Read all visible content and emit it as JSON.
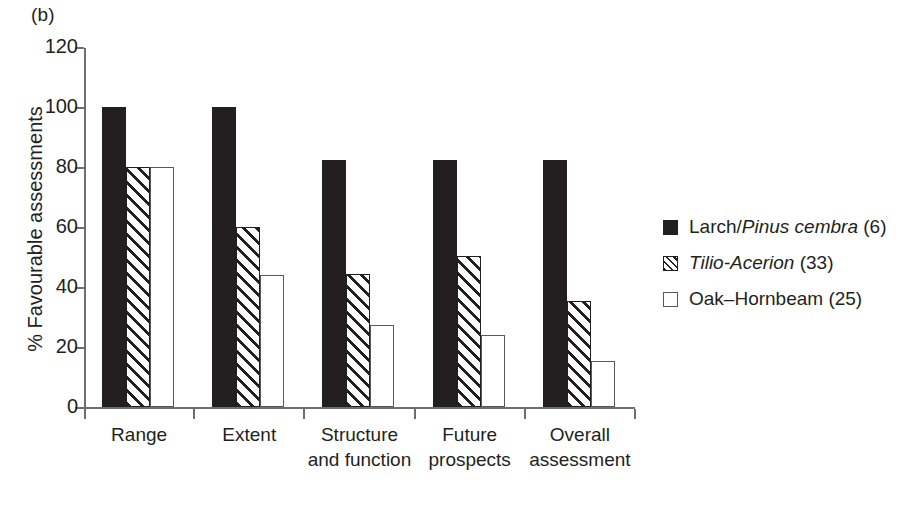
{
  "panel": {
    "label": "(b)"
  },
  "chart_data": {
    "type": "bar",
    "title": "",
    "panel_label": "(b)",
    "xlabel": "Habitat parameter",
    "ylabel": "% Favourable assessments",
    "ylim": [
      0,
      120
    ],
    "yticks": [
      0,
      20,
      40,
      60,
      80,
      100,
      120
    ],
    "ytick_labels": [
      "0",
      "20",
      "40",
      "60",
      "80",
      "100",
      "120"
    ],
    "grid": false,
    "legend_position": "right",
    "categories": [
      "Range",
      "Extent",
      "Structure and function",
      "Future prospects",
      "Overall assessment"
    ],
    "category_lines": [
      [
        "Range",
        ""
      ],
      [
        "Extent",
        ""
      ],
      [
        "Structure",
        "and function"
      ],
      [
        "Future",
        "prospects"
      ],
      [
        "Overall",
        "assessment"
      ]
    ],
    "series": [
      {
        "name": "Larch/Pinus cembra (6)",
        "legend_prefix": "Larch/",
        "legend_italic": "Pinus cembra",
        "legend_suffix": " (6)",
        "count": 6,
        "fill": "solid",
        "color": "#231f20",
        "values": [
          100,
          100,
          82.5,
          82.5,
          82.5
        ]
      },
      {
        "name": "Tilio-Acerion (33)",
        "legend_prefix": "",
        "legend_italic": "Tilio-Acerion",
        "legend_suffix": " (33)",
        "count": 33,
        "fill": "hatched",
        "color": "#231f20",
        "values": [
          80,
          60,
          44.5,
          50.5,
          35.5
        ]
      },
      {
        "name": "Oak–Hornbeam (25)",
        "legend_prefix": "Oak–Hornbeam",
        "legend_italic": "",
        "legend_suffix": " (25)",
        "count": 25,
        "fill": "open",
        "color": "#ffffff",
        "values": [
          80,
          44,
          27.5,
          24,
          15.5
        ]
      }
    ]
  }
}
